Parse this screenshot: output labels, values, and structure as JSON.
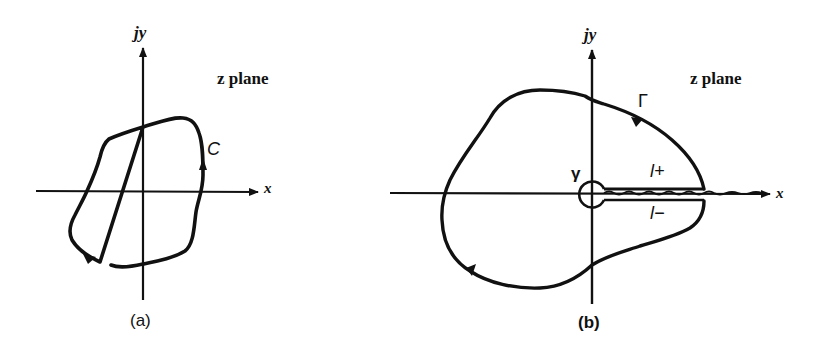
{
  "figure": {
    "panels": [
      {
        "id": "a",
        "caption": "(a)",
        "y_axis_label": "jy",
        "x_axis_label": "x",
        "plane_label": "z plane",
        "contour_label": "C"
      },
      {
        "id": "b",
        "caption": "(b)",
        "y_axis_label": "jy",
        "x_axis_label": "x",
        "plane_label": "z plane",
        "outer_contour_label": "Γ",
        "small_circle_label": "γ",
        "upper_cut_label": "l+",
        "lower_cut_label": "l−"
      }
    ],
    "colors": {
      "ink": "#111111",
      "background": "#ffffff"
    }
  }
}
